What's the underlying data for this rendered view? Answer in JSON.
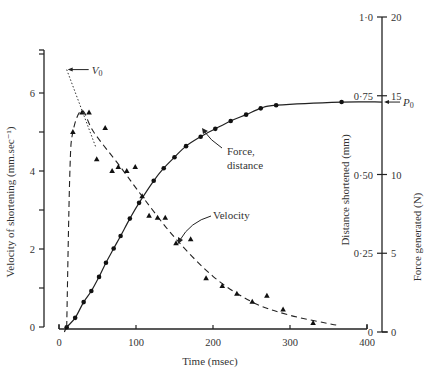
{
  "chart_data": {
    "type": "line",
    "title": "",
    "xlabel": "Time (msec)",
    "ylabel_left": "Velocity of shortening (mm.sec⁻¹)",
    "ylabel_right_inner": "Distance shortened (mm)",
    "ylabel_right_outer": "Force generated (N)",
    "xlim": [
      0,
      400
    ],
    "ylim_left": [
      0,
      7
    ],
    "ylim_right_distance": [
      0,
      1.0
    ],
    "ylim_right_force": [
      0,
      20
    ],
    "x_ticks": [
      "0",
      "100",
      "200",
      "300",
      "400"
    ],
    "y_left_ticks": [
      "0",
      "2",
      "4",
      "6"
    ],
    "y_right_distance_ticks": [
      "0",
      "0·25",
      "0·50",
      "0·75",
      "1·0"
    ],
    "y_right_force_ticks": [
      "0",
      "5",
      "10",
      "15",
      "20"
    ],
    "grid": false,
    "annotations": [
      {
        "text": "V₀",
        "note": "extrapolated max velocity ~6.6 at t=10"
      },
      {
        "text": "P₀",
        "note": "plateau force ~15.7 N"
      },
      {
        "text": "Force,\ndistance",
        "note": "label for circle series"
      },
      {
        "text": "Velocity",
        "note": "label for triangle series"
      }
    ],
    "series": [
      {
        "name": "Force, distance",
        "marker": "circle",
        "line": "solid",
        "axis": "right",
        "x": [
          10,
          21,
          32,
          42,
          52,
          61,
          71,
          80,
          92,
          104,
          123,
          136,
          150,
          165,
          184,
          203,
          223,
          243,
          262,
          282,
          367
        ],
        "values": [
          0.3,
          0.9,
          1.9,
          2.6,
          3.5,
          4.4,
          5.3,
          6.1,
          7.2,
          8.2,
          9.6,
          10.4,
          11.1,
          11.8,
          12.4,
          12.9,
          13.4,
          13.8,
          14.2,
          14.4,
          14.6
        ]
      },
      {
        "name": "Velocity",
        "marker": "triangle",
        "line": "dashed",
        "axis": "left",
        "x": [
          18,
          30,
          39,
          49,
          60,
          69,
          77,
          88,
          99,
          108,
          117,
          128,
          138,
          152,
          171,
          191,
          212,
          231,
          251,
          270,
          291,
          330
        ],
        "values": [
          5.0,
          5.5,
          5.5,
          4.3,
          5.1,
          4.0,
          4.1,
          4.0,
          4.1,
          3.35,
          2.85,
          2.8,
          2.8,
          2.15,
          2.25,
          1.25,
          1.05,
          0.85,
          0.65,
          0.8,
          0.45,
          0.1
        ]
      },
      {
        "name": "V0 extrapolation",
        "marker": "none",
        "line": "dotted",
        "axis": "left",
        "x": [
          10,
          48
        ],
        "values": [
          6.6,
          4.6
        ]
      }
    ]
  },
  "labels": {
    "xlabel": "Time (msec)",
    "ylabel_left": "Velocity of shortening (mm.sec⁻¹)",
    "ylabel_distance": "Distance shortened (mm)",
    "ylabel_force": "Force generated (N)",
    "v0": "V",
    "v0_sub": "0",
    "p0": "P",
    "p0_sub": "0",
    "force_label_1": "Force,",
    "force_label_2": "distance",
    "velocity_label": "Velocity"
  }
}
